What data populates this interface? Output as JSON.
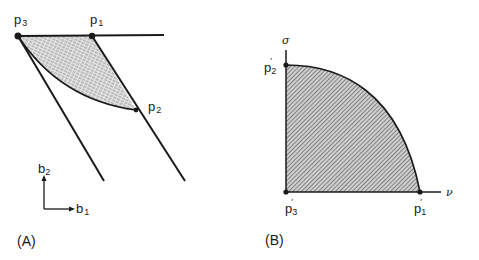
{
  "panel_a": {
    "label": "(A)",
    "points": {
      "p3": {
        "base": "p",
        "sub": "3"
      },
      "p1": {
        "base": "p",
        "sub": "1"
      },
      "p2": {
        "base": "p",
        "sub": "2"
      }
    },
    "axes": {
      "b1": {
        "base": "b",
        "sub": "1"
      },
      "b2": {
        "base": "b",
        "sub": "2"
      }
    }
  },
  "panel_b": {
    "label": "(B)",
    "axis_y_label": "σ",
    "axis_x_label": "ν",
    "points": {
      "p2p": {
        "base": "p",
        "sub": "2",
        "prime": "′"
      },
      "p3p": {
        "base": "p",
        "sub": "3",
        "prime": "′"
      },
      "p1p": {
        "base": "p",
        "sub": "1",
        "prime": "′"
      }
    }
  },
  "colors": {
    "ink": "#1a1a1a",
    "hatch": "#555555",
    "fill_a": "#d8d8d8",
    "fill_b": "#bdbdbd"
  }
}
